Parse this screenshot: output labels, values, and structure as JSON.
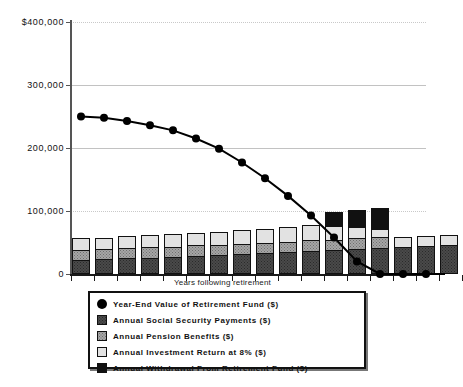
{
  "chart_data": {
    "type": "bar",
    "title": "",
    "xlabel": "Years following retirement",
    "ylabel": "",
    "ylim": [
      0,
      400000
    ],
    "yticks": [
      0,
      100000,
      200000,
      300000,
      400000
    ],
    "ytick_labels": [
      "0",
      "100,000",
      "200,000",
      "300,000",
      "$400,000"
    ],
    "grid": true,
    "legend_position": "bottom",
    "categories": [
      1,
      2,
      3,
      4,
      5,
      6,
      7,
      8,
      9,
      10,
      11,
      12,
      13,
      14,
      15,
      16,
      17
    ],
    "series": [
      {
        "name": "Annual Social Security Payments ($)",
        "type": "bar-stack",
        "color": "#4a4a4a",
        "values": [
          22000,
          24000,
          25000,
          26000,
          27000,
          29000,
          30000,
          32000,
          33000,
          35000,
          37000,
          38000,
          40000,
          42000,
          43000,
          44000,
          46000
        ]
      },
      {
        "name": "Annual Pension Benefits ($)",
        "type": "bar-stack",
        "color": "#a6a6a6",
        "values": [
          18000,
          18000,
          18000,
          18000,
          18000,
          18000,
          18000,
          18000,
          18000,
          18000,
          18000,
          18000,
          18000,
          18000,
          0,
          0,
          0
        ]
      },
      {
        "name": "Annual Investment Return at 8% ($)",
        "type": "bar-stack",
        "color": "#e2e2e2",
        "values": [
          20000,
          19000,
          20000,
          21000,
          21000,
          21000,
          22000,
          23000,
          24000,
          25000,
          26000,
          24000,
          20000,
          14000,
          18000,
          18000,
          17000
        ]
      },
      {
        "name": "Annual Withdrawal From Retirement Fund ($)",
        "type": "bar-stack",
        "color": "#111111",
        "values": [
          0,
          0,
          0,
          0,
          0,
          0,
          0,
          0,
          0,
          0,
          0,
          24000,
          29000,
          36000,
          0,
          0,
          0
        ]
      },
      {
        "name": "Year-End Value of Retirement Fund ($)",
        "type": "line",
        "color": "#000000",
        "marker": "circle",
        "values": [
          250000,
          248000,
          243000,
          236000,
          228000,
          215000,
          199000,
          177000,
          152000,
          124000,
          93000,
          58000,
          20000,
          0,
          0,
          0,
          0
        ]
      }
    ],
    "legend_entries": [
      {
        "label": "Year-End Value of Retirement Fund ($)",
        "swatch": "dot",
        "color": "#000000"
      },
      {
        "label": "Annual Social Security Payments ($)",
        "swatch": "dark-dotted",
        "color": "#4a4a4a"
      },
      {
        "label": "Annual Pension Benefits ($)",
        "swatch": "gray-dotted",
        "color": "#a6a6a6"
      },
      {
        "label": "Annual Investment Return at 8% ($)",
        "swatch": "light",
        "color": "#e2e2e2"
      },
      {
        "label": "Annual Withdrawal From Retirement Fund ($)",
        "swatch": "black",
        "color": "#111111"
      }
    ]
  }
}
